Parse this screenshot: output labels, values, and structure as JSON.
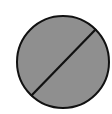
{
  "figure": {
    "shape": "circle-with-diagonal",
    "icon": "empty-set-icon",
    "fill_color": "#8f8f8f",
    "stroke_color": "#111111",
    "background": "#ffffff"
  }
}
